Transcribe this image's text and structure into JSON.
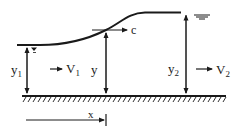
{
  "diagram": {
    "type": "surge-wave-open-channel",
    "labels": {
      "y1": {
        "main": "y",
        "sub": "1"
      },
      "V1": {
        "main": "V",
        "sub": "1"
      },
      "y": {
        "main": "y"
      },
      "c": {
        "main": "c"
      },
      "y2": {
        "main": "y",
        "sub": "2"
      },
      "V2": {
        "main": "V",
        "sub": "2"
      },
      "x": {
        "main": "x"
      }
    },
    "colors": {
      "stroke": "#1a1a1a",
      "background": "#ffffff"
    }
  }
}
